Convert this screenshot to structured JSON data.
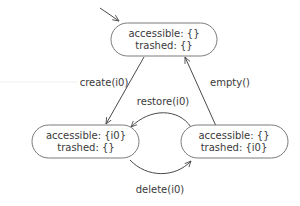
{
  "diagram": {
    "type": "state-machine",
    "initial_state": "s0",
    "states": [
      {
        "id": "s0",
        "accessible": "accessible: {}",
        "trashed": "trashed: {}"
      },
      {
        "id": "s1",
        "accessible": "accessible: {i0}",
        "trashed": "trashed: {}"
      },
      {
        "id": "s2",
        "accessible": "accessible: {}",
        "trashed": "trashed: {i0}"
      }
    ],
    "transitions": [
      {
        "from": "s0",
        "to": "s1",
        "label": "create(i0)"
      },
      {
        "from": "s2",
        "to": "s0",
        "label": "empty()"
      },
      {
        "from": "s2",
        "to": "s1",
        "label": "restore(i0)"
      },
      {
        "from": "s1",
        "to": "s2",
        "label": "delete(i0)"
      }
    ],
    "colors": {
      "stroke": "#7a7a7a",
      "edge": "#4a4a4a",
      "text": "#3a3a3a",
      "background": "#ffffff"
    }
  }
}
